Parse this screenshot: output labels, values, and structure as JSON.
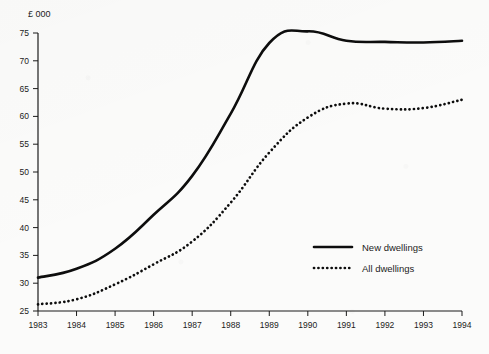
{
  "chart_data": {
    "type": "line",
    "title": "",
    "subtitle": "",
    "xlabel": "",
    "ylabel": "",
    "unit_label": "£ 000",
    "x": [
      1983,
      1984,
      1985,
      1986,
      1987,
      1988,
      1989,
      1990,
      1991,
      1992,
      1993,
      1994
    ],
    "categories": [
      "1983",
      "1984",
      "1985",
      "1986",
      "1987",
      "1988",
      "1989",
      "1990",
      "1991",
      "1992",
      "1993",
      "1994"
    ],
    "xlim": [
      1983,
      1994
    ],
    "ylim": [
      25,
      75
    ],
    "yticks": [
      25,
      30,
      35,
      40,
      45,
      50,
      55,
      60,
      65,
      70,
      75
    ],
    "ytick_labels": [
      "25",
      "30",
      "35",
      "40",
      "45",
      "50",
      "55",
      "60",
      "65",
      "70",
      "75"
    ],
    "grid": false,
    "legend_position": "center-right",
    "series": [
      {
        "name": "New dwellings",
        "style": "solid",
        "values": [
          31.0,
          32.6,
          36.2,
          42.3,
          49.3,
          60.5,
          73.2,
          75.3,
          73.6,
          73.4,
          73.3,
          73.6
        ]
      },
      {
        "name": "All dwellings",
        "style": "dotted",
        "values": [
          26.2,
          27.1,
          29.8,
          33.4,
          37.5,
          44.5,
          53.5,
          59.8,
          62.3,
          61.4,
          61.5,
          63.0
        ]
      }
    ]
  },
  "legend": {
    "items": [
      {
        "label": "New dwellings",
        "style": "solid"
      },
      {
        "label": "All dwellings",
        "style": "dotted"
      }
    ]
  }
}
